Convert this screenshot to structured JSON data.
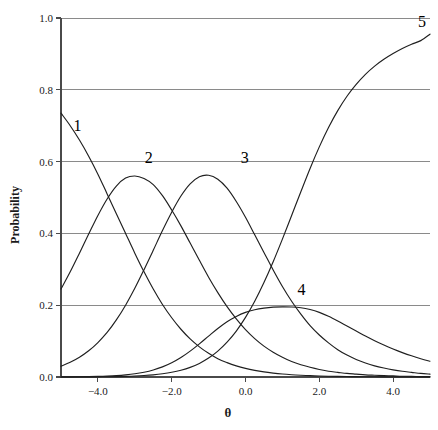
{
  "chart_data": {
    "type": "line",
    "title": "",
    "subtitle": "",
    "xlabel": "θ",
    "ylabel": "Probability",
    "xlim": [
      -5.0,
      5.0
    ],
    "ylim": [
      0.0,
      1.0
    ],
    "xticks": [
      "-4.0",
      "-2.0",
      "0.0",
      "2.0",
      "4.0"
    ],
    "xtick_values": [
      -4.0,
      -2.0,
      0.0,
      2.0,
      4.0
    ],
    "yticks": [
      "0.0",
      "0.2",
      "0.4",
      "0.6",
      "0.8",
      "1.0"
    ],
    "ytick_values": [
      0.0,
      0.2,
      0.4,
      0.6,
      0.8,
      1.0
    ],
    "grid": "horizontal",
    "legend_position": "inline-curve-labels",
    "line_color": "#1f1f1f",
    "grid_color": "#8a8a8a",
    "axis_color": "#4a4a4a",
    "x": [
      -5.0,
      -4.75,
      -4.5,
      -4.25,
      -4.0,
      -3.75,
      -3.5,
      -3.25,
      -3.0,
      -2.75,
      -2.5,
      -2.25,
      -2.0,
      -1.75,
      -1.5,
      -1.25,
      -1.0,
      -0.75,
      -0.5,
      -0.25,
      0.0,
      0.25,
      0.5,
      0.75,
      1.0,
      1.25,
      1.5,
      1.75,
      2.0,
      2.25,
      2.5,
      2.75,
      3.0,
      3.25,
      3.5,
      3.75,
      4.0,
      4.25,
      4.5,
      4.75,
      5.0
    ],
    "series": [
      {
        "name": "1",
        "label": "1",
        "label_x": -4.55,
        "label_y": 0.685,
        "values": [
          0.735,
          0.7,
          0.66,
          0.615,
          0.565,
          0.51,
          0.455,
          0.4,
          0.345,
          0.293,
          0.245,
          0.202,
          0.165,
          0.133,
          0.106,
          0.084,
          0.066,
          0.051,
          0.04,
          0.031,
          0.024,
          0.0185,
          0.0142,
          0.0109,
          0.0083,
          0.0064,
          0.0049,
          0.0037,
          0.0028,
          0.0022,
          0.0017,
          0.0013,
          0.001,
          0.0007,
          0.0006,
          0.0004,
          0.0003,
          0.0003,
          0.0002,
          0.0001,
          0.0001
        ]
      },
      {
        "name": "2",
        "label": "2",
        "label_x": -2.62,
        "label_y": 0.595,
        "values": [
          0.245,
          0.293,
          0.345,
          0.398,
          0.45,
          0.496,
          0.532,
          0.554,
          0.56,
          0.553,
          0.536,
          0.505,
          0.465,
          0.421,
          0.373,
          0.325,
          0.278,
          0.235,
          0.196,
          0.162,
          0.132,
          0.107,
          0.086,
          0.069,
          0.055,
          0.043,
          0.034,
          0.027,
          0.021,
          0.016,
          0.013,
          0.01,
          0.008,
          0.006,
          0.005,
          0.004,
          0.003,
          0.002,
          0.002,
          0.001,
          0.001
        ]
      },
      {
        "name": "3",
        "label": "3",
        "label_x": -0.02,
        "label_y": 0.595,
        "values": [
          0.03,
          0.041,
          0.055,
          0.073,
          0.096,
          0.124,
          0.159,
          0.2,
          0.247,
          0.299,
          0.353,
          0.408,
          0.459,
          0.504,
          0.538,
          0.558,
          0.562,
          0.551,
          0.526,
          0.489,
          0.445,
          0.396,
          0.347,
          0.298,
          0.252,
          0.211,
          0.175,
          0.143,
          0.117,
          0.095,
          0.076,
          0.061,
          0.049,
          0.039,
          0.031,
          0.025,
          0.02,
          0.016,
          0.013,
          0.01,
          0.008
        ]
      },
      {
        "name": "4",
        "label": "4",
        "label_x": 1.52,
        "label_y": 0.228,
        "values": [
          0.0002,
          0.0004,
          0.0006,
          0.001,
          0.0016,
          0.0025,
          0.0039,
          0.006,
          0.009,
          0.0134,
          0.0196,
          0.0282,
          0.0396,
          0.0542,
          0.072,
          0.0923,
          0.114,
          0.1352,
          0.154,
          0.1688,
          0.18,
          0.1875,
          0.192,
          0.1947,
          0.1955,
          0.195,
          0.193,
          0.188,
          0.18,
          0.169,
          0.156,
          0.142,
          0.128,
          0.114,
          0.101,
          0.089,
          0.078,
          0.068,
          0.059,
          0.051,
          0.044
        ]
      },
      {
        "name": "5",
        "label": "5",
        "label_x": 4.78,
        "label_y": 0.975,
        "values": [
          0.0001,
          0.0001,
          0.0002,
          0.0003,
          0.0005,
          0.0008,
          0.0012,
          0.0018,
          0.0027,
          0.0041,
          0.0061,
          0.009,
          0.0131,
          0.0189,
          0.0269,
          0.0379,
          0.0527,
          0.0721,
          0.097,
          0.128,
          0.166,
          0.211,
          0.263,
          0.321,
          0.384,
          0.45,
          0.516,
          0.581,
          0.641,
          0.695,
          0.742,
          0.782,
          0.815,
          0.843,
          0.866,
          0.885,
          0.901,
          0.915,
          0.927,
          0.937,
          0.955
        ]
      }
    ]
  }
}
